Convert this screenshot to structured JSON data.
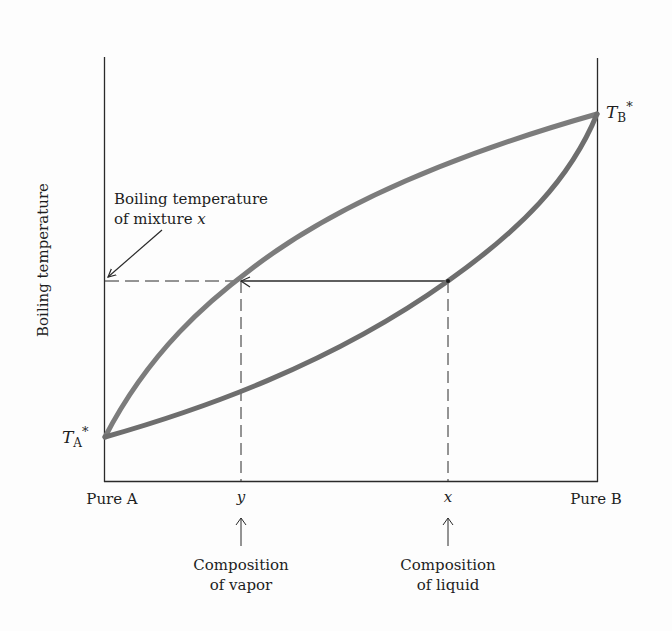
{
  "figure": {
    "type": "boiling-point composition diagram",
    "y_axis_label": "Boiling temperature",
    "x_axis": {
      "left_label": "Pure A",
      "right_label": "Pure B",
      "markers": [
        {
          "symbol": "y",
          "caption_line1": "Composition",
          "caption_line2": "of vapor"
        },
        {
          "symbol": "x",
          "caption_line1": "Composition",
          "caption_line2": "of liquid"
        }
      ]
    },
    "endpoints": {
      "left": {
        "symbol": "T",
        "subscript": "A",
        "superscript": "*"
      },
      "right": {
        "symbol": "T",
        "subscript": "B",
        "superscript": "*"
      }
    },
    "annotation": {
      "line1": "Boiling temperature",
      "line2_prefix": "of mixture ",
      "line2_var": "x"
    },
    "curves": [
      {
        "name": "vapor curve (upper)",
        "color": "#7a7a7a"
      },
      {
        "name": "liquid curve (lower)",
        "color": "#6e6e6e"
      }
    ],
    "colors": {
      "axis": "#2a2a2a",
      "text": "#1e1e1e",
      "curve_upper": "#7c7c7c",
      "curve_lower": "#707070"
    }
  }
}
